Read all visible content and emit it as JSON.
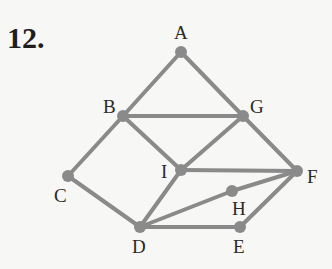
{
  "problem_number": "12.",
  "graph": {
    "edge_color": "#8a8a8a",
    "nodes": [
      {
        "id": "A",
        "x": 181,
        "y": 52,
        "lx": 174,
        "ly": 39
      },
      {
        "id": "B",
        "x": 123,
        "y": 116,
        "lx": 103,
        "ly": 113
      },
      {
        "id": "G",
        "x": 243,
        "y": 116,
        "lx": 250,
        "ly": 113
      },
      {
        "id": "I",
        "x": 181,
        "y": 170,
        "lx": 161,
        "ly": 178
      },
      {
        "id": "C",
        "x": 68,
        "y": 176,
        "lx": 54,
        "ly": 202
      },
      {
        "id": "D",
        "x": 140,
        "y": 227,
        "lx": 132,
        "ly": 253
      },
      {
        "id": "F",
        "x": 297,
        "y": 171,
        "lx": 307,
        "ly": 183
      },
      {
        "id": "H",
        "x": 232,
        "y": 191,
        "lx": 232,
        "ly": 215
      },
      {
        "id": "E",
        "x": 240,
        "y": 227,
        "lx": 233,
        "ly": 253
      }
    ],
    "edges": [
      [
        "A",
        "B"
      ],
      [
        "A",
        "G"
      ],
      [
        "B",
        "G"
      ],
      [
        "B",
        "I"
      ],
      [
        "B",
        "C"
      ],
      [
        "G",
        "I"
      ],
      [
        "G",
        "F"
      ],
      [
        "I",
        "F"
      ],
      [
        "I",
        "D"
      ],
      [
        "C",
        "D"
      ],
      [
        "D",
        "H"
      ],
      [
        "H",
        "F"
      ],
      [
        "D",
        "E"
      ],
      [
        "E",
        "F"
      ]
    ]
  }
}
